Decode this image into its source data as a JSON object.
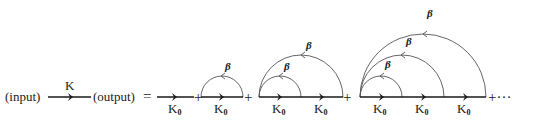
{
  "equation": {
    "lhs": {
      "input_label": "(input)",
      "propagator_label": "K",
      "output_label": "(output)"
    },
    "equals": "=",
    "plus": "+",
    "ellipsis": "+···",
    "free_propagator_label": "K",
    "free_propagator_subscript": "0",
    "interaction_label": "β",
    "terms": [
      {
        "order": 0,
        "segments": 1,
        "arcs": 0
      },
      {
        "order": 1,
        "segments": 1,
        "arcs": 1
      },
      {
        "order": 2,
        "segments": 2,
        "arcs": 2
      },
      {
        "order": 3,
        "segments": 3,
        "arcs": 3
      }
    ]
  },
  "colors": {
    "line": "#1a1a1a",
    "arc": "#555555",
    "background": "#ffffff"
  }
}
